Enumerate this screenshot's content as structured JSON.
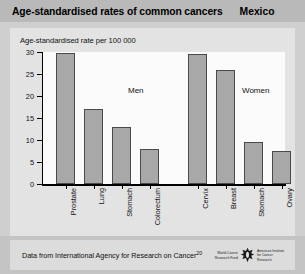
{
  "header": {
    "title": "Age-standardised rates of common cancers",
    "country": "Mexico"
  },
  "footer": {
    "source_text": "Data from International Agency for Research on Cancer",
    "source_ref": "20",
    "logo_left": "World Cancer Research Fund",
    "logo_right": "American Institute for Cancer Research",
    "logo_icon": "wcrf-aicr-logo"
  },
  "chart_data": {
    "type": "bar",
    "title": "Age-standardised rates of common cancers",
    "subtitle": "Age-standardised rate per 100 000",
    "xlabel": "",
    "ylabel": "Age-standardised rate per 100 000",
    "ylim": [
      0,
      30
    ],
    "yticks": [
      0,
      5,
      10,
      15,
      20,
      25,
      30
    ],
    "ytick_labels": [
      "0",
      "5",
      "10",
      "15",
      "20",
      "25",
      "30"
    ],
    "grid": false,
    "legend": "none",
    "groups": [
      {
        "name": "Men",
        "categories": [
          "Prostate",
          "Lung",
          "Stomach",
          "Colorectum"
        ],
        "values": [
          29.7,
          17.0,
          13.0,
          8.0
        ]
      },
      {
        "name": "Women",
        "categories": [
          "Cervix",
          "Breast",
          "Stomach",
          "Ovary"
        ],
        "values": [
          29.5,
          26.0,
          9.5,
          7.5
        ]
      }
    ],
    "colors": {
      "bar_fill": "#a8a8a8",
      "bar_edge": "#4a4a4a",
      "plot_background": "#fbfbfb",
      "panel_background": "#e3e3e3",
      "title_background": "#b9b9b9",
      "footer_background": "#dcdcdc"
    }
  }
}
